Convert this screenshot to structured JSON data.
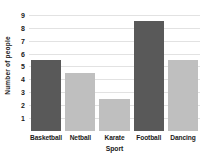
{
  "chart_data": {
    "type": "bar",
    "title": "",
    "xlabel": "Sport",
    "ylabel": "Number of people",
    "categories": [
      "Basketball",
      "Netball",
      "Karate",
      "Football",
      "Dancing"
    ],
    "values": [
      5.5,
      4.5,
      2.5,
      8.5,
      5.5
    ],
    "bar_colors": [
      "#595959",
      "#bfbfbf",
      "#bfbfbf",
      "#595959",
      "#bfbfbf"
    ],
    "ylim": [
      0,
      9.3
    ],
    "yticks": [
      1,
      2,
      3,
      4,
      5,
      6,
      7,
      8,
      9
    ],
    "ytick_labels": [
      "1",
      "2",
      "3",
      "4",
      "5",
      "6",
      "7",
      "8",
      "9"
    ],
    "grid": true,
    "grid_axis": "y",
    "grid_color": "#e2e2e2",
    "legend": false,
    "legend_position": "none"
  },
  "colors": {
    "dark_bar": "#595959",
    "light_bar": "#bfbfbf",
    "gridline": "#e2e2e2",
    "text": "#1a1a1a",
    "background": "#ffffff"
  }
}
